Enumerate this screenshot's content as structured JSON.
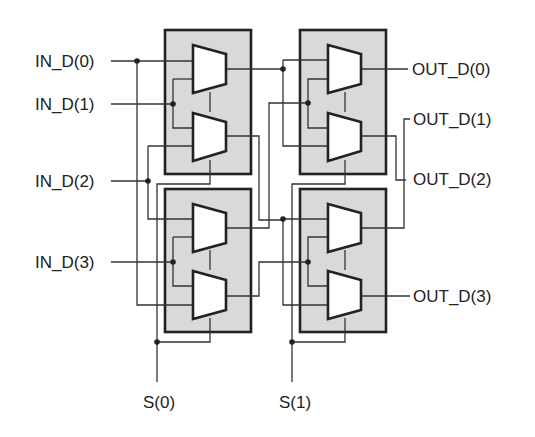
{
  "diagram": {
    "inputs": [
      {
        "label": "IN_D(0)"
      },
      {
        "label": "IN_D(1)"
      },
      {
        "label": "IN_D(2)"
      },
      {
        "label": "IN_D(3)"
      }
    ],
    "outputs": [
      {
        "label": "OUT_D(0)"
      },
      {
        "label": "OUT_D(1)"
      },
      {
        "label": "OUT_D(2)"
      },
      {
        "label": "OUT_D(3)"
      }
    ],
    "selects": [
      {
        "label": "S(0)"
      },
      {
        "label": "S(1)"
      }
    ],
    "stages": [
      {
        "name": "stage-1",
        "blocks": 2,
        "muxes_per_block": 2,
        "select": "S(0)"
      },
      {
        "name": "stage-2",
        "blocks": 2,
        "muxes_per_block": 2,
        "select": "S(1)"
      }
    ],
    "colors": {
      "block_fill": "#d9d9d9",
      "line": "#222222",
      "mux_fill": "#ffffff"
    }
  }
}
